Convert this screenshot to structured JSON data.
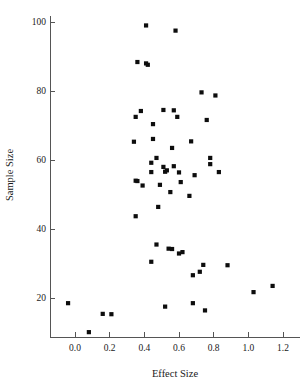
{
  "chart_data": {
    "type": "scatter",
    "title": "",
    "xlabel": "Effect Size",
    "ylabel": "Sample Size",
    "xlim": [
      -0.1,
      1.27
    ],
    "ylim": [
      5,
      103
    ],
    "xticks": [
      0.0,
      0.2,
      0.4,
      0.6,
      0.8,
      1.0,
      1.2
    ],
    "xtick_labels": [
      "0.0",
      "0.2",
      "0.4",
      "0.6",
      "0.8",
      "1.0",
      "1.2"
    ],
    "yticks": [
      20,
      40,
      60,
      80,
      100
    ],
    "ytick_labels": [
      "20",
      "40",
      "60",
      "80",
      "100"
    ],
    "grid": false,
    "legend": null,
    "marker": "filled-square-dot",
    "marker_color": "#0d0d0d",
    "marker_size": 2.1,
    "n_points": 67,
    "points": [
      [
        0.41,
        99.0
      ],
      [
        0.58,
        97.5
      ],
      [
        0.36,
        88.4
      ],
      [
        0.41,
        88.0
      ],
      [
        0.42,
        87.6
      ],
      [
        0.73,
        79.6
      ],
      [
        0.81,
        78.7
      ],
      [
        0.38,
        74.2
      ],
      [
        0.51,
        74.5
      ],
      [
        0.57,
        74.4
      ],
      [
        0.35,
        72.5
      ],
      [
        0.59,
        72.5
      ],
      [
        0.76,
        71.6
      ],
      [
        0.45,
        70.4
      ],
      [
        0.67,
        65.4
      ],
      [
        0.34,
        65.3
      ],
      [
        0.45,
        66.1
      ],
      [
        0.56,
        63.5
      ],
      [
        0.47,
        60.6
      ],
      [
        0.78,
        60.6
      ],
      [
        0.44,
        59.2
      ],
      [
        0.78,
        58.8
      ],
      [
        0.51,
        58.0
      ],
      [
        0.57,
        58.2
      ],
      [
        0.53,
        57.0
      ],
      [
        0.52,
        56.6
      ],
      [
        0.44,
        56.5
      ],
      [
        0.6,
        56.4
      ],
      [
        0.69,
        55.6
      ],
      [
        0.83,
        56.5
      ],
      [
        0.35,
        54.0
      ],
      [
        0.36,
        53.9
      ],
      [
        0.61,
        53.6
      ],
      [
        0.39,
        52.6
      ],
      [
        0.49,
        52.8
      ],
      [
        0.55,
        50.7
      ],
      [
        0.66,
        49.6
      ],
      [
        0.48,
        46.4
      ],
      [
        0.35,
        43.7
      ],
      [
        0.47,
        35.5
      ],
      [
        0.54,
        34.3
      ],
      [
        0.56,
        34.2
      ],
      [
        0.6,
        32.9
      ],
      [
        0.62,
        33.3
      ],
      [
        0.44,
        30.5
      ],
      [
        0.74,
        29.6
      ],
      [
        0.88,
        29.5
      ],
      [
        0.72,
        27.6
      ],
      [
        0.68,
        26.6
      ],
      [
        1.14,
        23.5
      ],
      [
        1.03,
        21.7
      ],
      [
        -0.04,
        18.5
      ],
      [
        0.52,
        17.5
      ],
      [
        0.68,
        18.5
      ],
      [
        0.16,
        15.4
      ],
      [
        0.21,
        15.3
      ],
      [
        0.75,
        16.4
      ],
      [
        0.08,
        10.1
      ]
    ]
  }
}
